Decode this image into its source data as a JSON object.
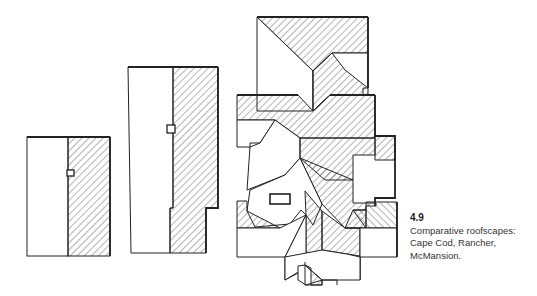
{
  "figure": {
    "number": "4.9",
    "caption_lines": [
      "Comparative roofscapes:",
      "Cape Cod, Rancher,",
      "McMansion."
    ],
    "colors": {
      "ink": "#222222",
      "hatch": "#444444",
      "paper": "#ffffff"
    },
    "drawings": [
      {
        "name": "Cape Cod",
        "description": "Simple gable roof, one side hatched, small chimney at ridge"
      },
      {
        "name": "Rancher",
        "description": "Long gable roof with stepped rear, chimney at ridge"
      },
      {
        "name": "McMansion",
        "description": "Complex multi-gable and hip roofscape with many intersecting planes"
      }
    ]
  }
}
